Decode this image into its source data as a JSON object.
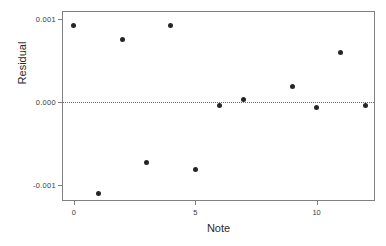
{
  "chart_data": {
    "type": "scatter",
    "title": "",
    "xlabel": "Note",
    "ylabel": "Residual",
    "x": [
      0,
      1,
      2,
      3,
      4,
      5,
      6,
      7,
      9,
      10,
      11,
      12
    ],
    "values": [
      0.00092,
      -0.00111,
      0.00075,
      -0.00073,
      0.00092,
      -0.00082,
      -5e-05,
      2e-05,
      0.00018,
      -7e-05,
      0.00059,
      -5e-05
    ],
    "xlim": [
      -0.45,
      12.45
    ],
    "ylim": [
      -0.00121,
      0.00108
    ],
    "xticks": [
      0,
      5,
      10
    ],
    "xticklabels": [
      "0",
      "5",
      "10"
    ],
    "yticks": [
      0.001,
      0.0,
      -0.001
    ],
    "yticklabels": [
      "0.001",
      "0.000",
      "-0.001"
    ],
    "grid": false,
    "legend": null,
    "annotations": [
      {
        "kind": "reference-line",
        "orientation": "horizontal",
        "value": 0.0,
        "style": "dotted"
      }
    ],
    "point_color": "#262626",
    "frame_color": "#808080",
    "reference_line_color": "#6a6a6a"
  }
}
